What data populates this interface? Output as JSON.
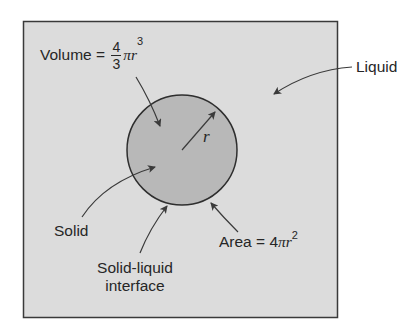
{
  "diagram": {
    "type": "sphere-in-liquid",
    "colors": {
      "box_fill": "#dcdcdc",
      "box_stroke": "#3a3a3a",
      "sphere_fill": "#b8b8b8",
      "sphere_stroke": "#2e2e2e",
      "arrow": "#3a3a3a",
      "text": "#262626"
    },
    "labels": {
      "volume": {
        "prefix": "Volume = ",
        "frac_num": "4",
        "frac_den": "3",
        "expr": "πr",
        "exp": "3"
      },
      "liquid": "Liquid",
      "radius": "r",
      "solid": "Solid",
      "interface_line1": "Solid-liquid",
      "interface_line2": "interface",
      "area": {
        "prefix": "Area = 4",
        "expr": "πr",
        "exp": "2"
      }
    }
  }
}
